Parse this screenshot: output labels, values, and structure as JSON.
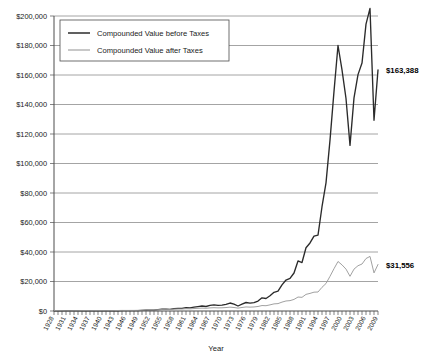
{
  "chart_data": {
    "type": "line",
    "title": "",
    "xlabel": "Year",
    "ylabel": "",
    "ylim": [
      0,
      200000
    ],
    "ytick_step": 20000,
    "ytick_labels": [
      "$0",
      "$20,000",
      "$40,000",
      "$60,000",
      "$80,000",
      "$100,000",
      "$120,000",
      "$140,000",
      "$160,000",
      "$180,000",
      "$200,000"
    ],
    "xlim": [
      1928,
      2009
    ],
    "xtick_labels": [
      "1928",
      "1931",
      "1934",
      "1937",
      "1940",
      "1943",
      "1946",
      "1949",
      "1952",
      "1955",
      "1958",
      "1961",
      "1964",
      "1967",
      "1970",
      "1973",
      "1976",
      "1979",
      "1982",
      "1985",
      "1988",
      "1991",
      "1994",
      "1997",
      "2000",
      "2003",
      "2006",
      "2009"
    ],
    "xtick_step": 3,
    "grid": true,
    "legend_position": "upper-left-inside",
    "x": [
      1928,
      1929,
      1930,
      1931,
      1932,
      1933,
      1934,
      1935,
      1936,
      1937,
      1938,
      1939,
      1940,
      1941,
      1942,
      1943,
      1944,
      1945,
      1946,
      1947,
      1948,
      1949,
      1950,
      1951,
      1952,
      1953,
      1954,
      1955,
      1956,
      1957,
      1958,
      1959,
      1960,
      1961,
      1962,
      1963,
      1964,
      1965,
      1966,
      1967,
      1968,
      1969,
      1970,
      1971,
      1972,
      1973,
      1974,
      1975,
      1976,
      1977,
      1978,
      1979,
      1980,
      1981,
      1982,
      1983,
      1984,
      1985,
      1986,
      1987,
      1988,
      1989,
      1990,
      1991,
      1992,
      1993,
      1994,
      1995,
      1996,
      1997,
      1998,
      1999,
      2000,
      2001,
      2002,
      2003,
      2004,
      2005,
      2006,
      2007,
      2008,
      2009
    ],
    "series": [
      {
        "name": "Compounded Value before Taxes",
        "color": "#2b2b2b",
        "end_label": "$163,388",
        "end_value": 163388,
        "values": [
          1000,
          920,
          690,
          390,
          360,
          550,
          545,
          800,
          1070,
          700,
          915,
          910,
          820,
          725,
          870,
          1095,
          1310,
          1780,
          1640,
          1730,
          1825,
          2170,
          2855,
          3540,
          4190,
          4150,
          6335,
          8335,
          8880,
          7925,
          11360,
          12725,
          12785,
          16215,
          14790,
          18160,
          21160,
          23805,
          21400,
          26520,
          29440,
          26940,
          28010,
          32020,
          38100,
          32510,
          23900,
          32790,
          40600,
          37700,
          40170,
          47580,
          63000,
          59900,
          72780,
          89180,
          94800,
          124800,
          148000,
          155800,
          181600,
          239000,
          231600,
          302000,
          325000,
          357800,
          362500,
          498000,
          612000,
          816000,
          1049000,
          1268000,
          1152000,
          1015000,
          791000,
          1018000,
          1129000,
          1184000,
          1370000,
          1445000,
          911000,
          1151000
        ],
        "scaled_note": "values shown are relative growth; rendered path uses normalized series"
      },
      {
        "name": "Compounded Value after Taxes",
        "color": "#9c9c9c",
        "end_label": "$31,556",
        "end_value": 31556,
        "values": [
          1000,
          930,
          760,
          520,
          490,
          640,
          640,
          830,
          1010,
          760,
          900,
          900,
          840,
          790,
          880,
          1020,
          1150,
          1380,
          1310,
          1360,
          1400,
          1560,
          1860,
          2130,
          2360,
          2340,
          3080,
          3650,
          3790,
          3520,
          4400,
          4660,
          4670,
          5370,
          5100,
          5800,
          6380,
          6840,
          6420,
          7320,
          7820,
          7380,
          7530,
          8170,
          9090,
          8280,
          6820,
          8310,
          9580,
          9160,
          9540,
          10700,
          12900,
          12500,
          14500,
          16800,
          17500,
          21000,
          23700,
          24500,
          27400,
          33000,
          32300,
          39300,
          41600,
          44500,
          44900,
          56000,
          65000,
          82000,
          100000,
          117000,
          109000,
          99000,
          82000,
          99000,
          107000,
          111000,
          124000,
          129000,
          90000,
          110000
        ],
        "scaled_note": "values shown are relative growth; rendered path uses normalized series"
      }
    ],
    "annotations": [
      {
        "text": "$163,388",
        "series": "Compounded Value before Taxes"
      },
      {
        "text": "$31,556",
        "series": "Compounded Value after Taxes"
      }
    ]
  },
  "legend": {
    "items": [
      {
        "label": "Compounded Value before Taxes",
        "color": "#2b2b2b"
      },
      {
        "label": "Compounded Value after Taxes",
        "color": "#9c9c9c"
      }
    ]
  },
  "axes": {
    "x_title": "Year"
  }
}
